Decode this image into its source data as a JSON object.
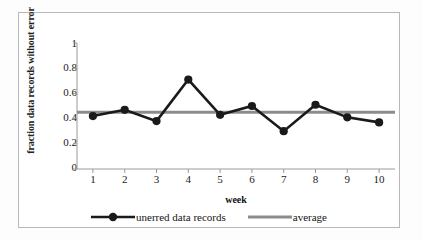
{
  "chart_data": {
    "type": "line",
    "title": "",
    "xlabel": "week",
    "ylabel": "fraction data records without error",
    "categories": [
      "1",
      "2",
      "3",
      "4",
      "5",
      "6",
      "7",
      "8",
      "9",
      "10"
    ],
    "x": [
      1,
      2,
      3,
      4,
      5,
      6,
      7,
      8,
      9,
      10
    ],
    "xlim": [
      0.5,
      10.5
    ],
    "ylim": [
      0,
      1
    ],
    "yticks": [
      "1",
      "0.8",
      "0.6",
      "0.4",
      "0.2",
      "0"
    ],
    "ytick_values": [
      1,
      0.8,
      0.6,
      0.4,
      0.2,
      0
    ],
    "grid": false,
    "legend_position": "bottom",
    "series": [
      {
        "name": "unerred data records",
        "type": "line",
        "color": "#1a1a1a",
        "marker": "circle",
        "values": [
          0.42,
          0.47,
          0.38,
          0.71,
          0.43,
          0.5,
          0.3,
          0.51,
          0.41,
          0.37
        ]
      },
      {
        "name": "average",
        "type": "line",
        "color": "#8c8c8c",
        "marker": "none",
        "constant_value": 0.45,
        "values": [
          0.45,
          0.45,
          0.45,
          0.45,
          0.45,
          0.45,
          0.45,
          0.45,
          0.45,
          0.45
        ]
      }
    ]
  },
  "axes": {
    "y_title": "fraction data records without error",
    "x_title": "week",
    "y_tick_labels": [
      "1",
      "0.8",
      "0.6",
      "0.4",
      "0.2",
      "0"
    ],
    "x_tick_labels": [
      "1",
      "2",
      "3",
      "4",
      "5",
      "6",
      "7",
      "8",
      "9",
      "10"
    ]
  },
  "legend": {
    "items": [
      {
        "label": "unerred data records",
        "color": "#1a1a1a",
        "style": "line-marker"
      },
      {
        "label": "average",
        "color": "#8c8c8c",
        "style": "line"
      }
    ]
  },
  "colors": {
    "series_primary": "#1a1a1a",
    "series_average": "#8c8c8c",
    "axis": "#9a9a9a",
    "border": "#b8b8b8",
    "background": "#ffffff"
  }
}
